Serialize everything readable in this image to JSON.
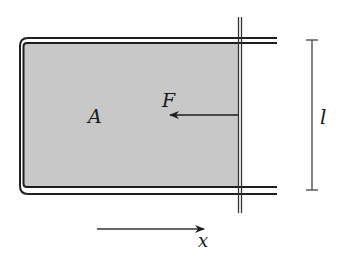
{
  "diagram": {
    "labels": {
      "area": "A",
      "force": "F",
      "length": "l",
      "axis": "x"
    },
    "colors": {
      "film_fill": "#c8c8c8",
      "frame_stroke": "#1e1e1e",
      "line_stroke": "#333333"
    },
    "components": [
      "wire-frame",
      "soap-film",
      "movable-rod",
      "force-arrow",
      "length-dimension",
      "x-axis-arrow"
    ]
  }
}
